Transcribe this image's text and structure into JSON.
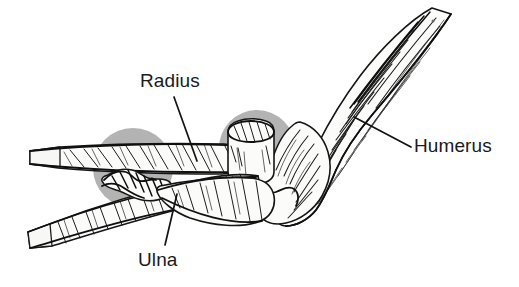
{
  "figure": {
    "background_color": "#ffffff",
    "width": 519,
    "height": 287
  },
  "labels": {
    "radius": "Radius",
    "ulna": "Ulna",
    "humerus": "Humerus"
  },
  "colors": {
    "ink": "#121212",
    "bone_fill": "#fbfbfa",
    "joint_highlight": "#a9a9a9",
    "background": "#ffffff",
    "label_text": "#1a1a1a"
  },
  "annotations": [
    {
      "name": "radius",
      "label": "Radius",
      "label_x": 140,
      "label_y": 71,
      "leader_from_x": 174,
      "leader_from_y": 97,
      "leader_to_x": 197,
      "leader_to_y": 161
    },
    {
      "name": "ulna",
      "label": "Ulna",
      "label_x": 138,
      "label_y": 250,
      "leader_from_x": 177,
      "leader_from_y": 194,
      "leader_to_x": 165,
      "leader_to_y": 245
    },
    {
      "name": "humerus",
      "label": "Humerus",
      "label_x": 414,
      "label_y": 136,
      "leader_from_x": 354,
      "leader_from_y": 117,
      "leader_to_x": 411,
      "leader_to_y": 147
    }
  ],
  "joint_highlights": [
    {
      "name": "proximal-radioulnar-highlight",
      "cx": 133,
      "cy": 168,
      "r": 40
    },
    {
      "name": "humeroradial-joint-highlight",
      "cx": 257,
      "cy": 148,
      "r": 38
    }
  ]
}
